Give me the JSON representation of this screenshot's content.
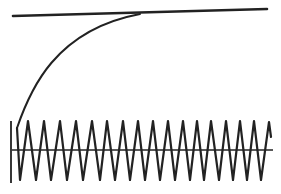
{
  "diagram": {
    "stroke_color": "#222222",
    "background": "#ffffff",
    "top_line": {
      "x1": 13,
      "y1": 16,
      "x2": 267,
      "y2": 9,
      "width": 2.6
    },
    "curve": {
      "path": "M17 128 C 30 90, 55 30, 140 14",
      "width": 2
    },
    "axis": {
      "x1": 12,
      "y1": 150,
      "x2": 273,
      "y2": 150,
      "width": 1.6
    },
    "vertical_bar": {
      "x1": 11,
      "y1": 121,
      "x2": 11,
      "y2": 183,
      "width": 1.8
    },
    "zigzag": {
      "width": 2.2,
      "points": [
        [
          17,
          128
        ],
        [
          20,
          180
        ],
        [
          28,
          121
        ],
        [
          36,
          180
        ],
        [
          44,
          121
        ],
        [
          51,
          180
        ],
        [
          60,
          121
        ],
        [
          67,
          180
        ],
        [
          76,
          121
        ],
        [
          83,
          180
        ],
        [
          92,
          121
        ],
        [
          100,
          180
        ],
        [
          107,
          121
        ],
        [
          115,
          180
        ],
        [
          123,
          121
        ],
        [
          130,
          180
        ],
        [
          138,
          121
        ],
        [
          145,
          180
        ],
        [
          153,
          121
        ],
        [
          160,
          180
        ],
        [
          168,
          121
        ],
        [
          175,
          180
        ],
        [
          183,
          121
        ],
        [
          190,
          180
        ],
        [
          197,
          121
        ],
        [
          204,
          180
        ],
        [
          211,
          121
        ],
        [
          219,
          180
        ],
        [
          226,
          121
        ],
        [
          233,
          180
        ],
        [
          240,
          121
        ],
        [
          247,
          180
        ],
        [
          254,
          121
        ],
        [
          261,
          180
        ],
        [
          269,
          122
        ],
        [
          271,
          137
        ]
      ]
    }
  }
}
